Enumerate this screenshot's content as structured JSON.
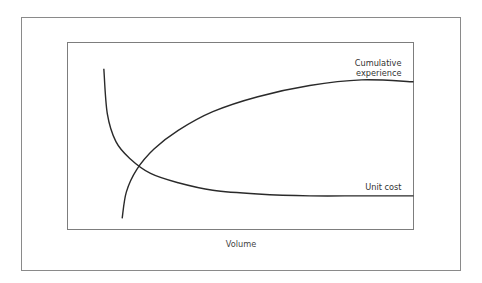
{
  "chart_data": {
    "type": "line",
    "title": "",
    "xlabel": "Volume",
    "ylabel": "",
    "xlim": [
      0,
      1
    ],
    "ylim": [
      0,
      1
    ],
    "grid": false,
    "legend": "none (curves labelled directly at right end)",
    "note": "Schematic conceptual diagram; no axis ticks shown. Values are normalized estimates of curve shape.",
    "series": [
      {
        "name": "Unit cost",
        "label_lines": [
          "Unit cost"
        ],
        "x": [
          0.105,
          0.115,
          0.14,
          0.18,
          0.24,
          0.32,
          0.42,
          0.55,
          0.7,
          0.85,
          1.0
        ],
        "y": [
          0.86,
          0.62,
          0.47,
          0.38,
          0.3,
          0.25,
          0.21,
          0.19,
          0.18,
          0.18,
          0.18
        ]
      },
      {
        "name": "Cumulative experience",
        "label_lines": [
          "Cumulative",
          "experience"
        ],
        "x": [
          0.158,
          0.17,
          0.2,
          0.25,
          0.32,
          0.42,
          0.55,
          0.7,
          0.85,
          1.0
        ],
        "y": [
          0.06,
          0.2,
          0.32,
          0.43,
          0.53,
          0.63,
          0.71,
          0.77,
          0.8,
          0.79
        ]
      }
    ]
  }
}
